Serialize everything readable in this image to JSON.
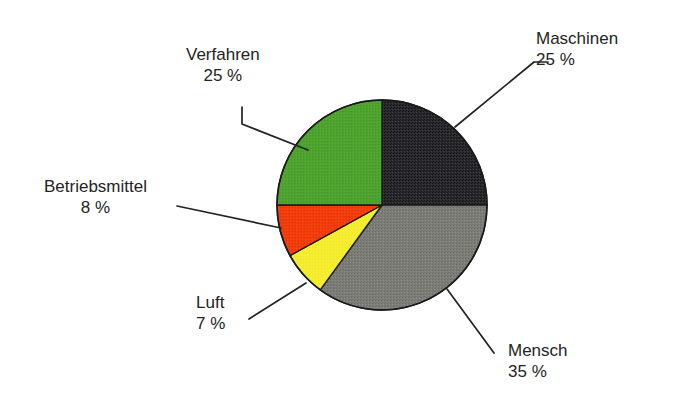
{
  "canvas": {
    "width": 675,
    "height": 415,
    "background": "#ffffff"
  },
  "chart_data": {
    "type": "pie",
    "title": "",
    "subtitle": "",
    "xlabel": "",
    "ylabel": "",
    "legend_position": "none",
    "grid": false,
    "units": "%",
    "total": 100,
    "start_angle_deg": 0,
    "direction": "clockwise",
    "categories": [
      "Maschinen",
      "Mensch",
      "Luft",
      "Betriebsmittel",
      "Verfahren"
    ],
    "values": [
      25,
      35,
      7,
      8,
      25
    ],
    "slices": [
      {
        "label": "Maschinen",
        "value": 25,
        "value_text": "25 %",
        "color": "#2a2a2e",
        "texture": "noise-dark",
        "start_deg": 0,
        "end_deg": 90
      },
      {
        "label": "Mensch",
        "value": 35,
        "value_text": "35 %",
        "color": "#7d7d78",
        "texture": "noise-gray",
        "start_deg": 90,
        "end_deg": 216
      },
      {
        "label": "Luft",
        "value": 7,
        "value_text": "7 %",
        "color": "#f5ee30",
        "texture": "none",
        "start_deg": 216,
        "end_deg": 241.2
      },
      {
        "label": "Betriebsmittel",
        "value": 8,
        "value_text": "8 %",
        "color": "#f23c0a",
        "texture": "none",
        "start_deg": 241.2,
        "end_deg": 270
      },
      {
        "label": "Verfahren",
        "value": 25,
        "value_text": "25 %",
        "color": "#4ea32e",
        "texture": "none",
        "start_deg": 270,
        "end_deg": 360
      }
    ],
    "geometry": {
      "center_x": 382,
      "center_y": 205,
      "radius": 105,
      "outline_color": "#1a1a1a",
      "outline_width": 1.6
    }
  },
  "labels": {
    "verfahren": {
      "name": "Verfahren",
      "value": "25 %"
    },
    "maschinen": {
      "name": "Maschinen",
      "value": "25 %"
    },
    "betriebsmittel": {
      "name": "Betriebsmittel",
      "value": "8 %"
    },
    "luft": {
      "name": "Luft",
      "value": "7 %"
    },
    "mensch": {
      "name": "Mensch",
      "value": "35 %"
    }
  },
  "leader_lines": {
    "color": "#232323",
    "width": 1.7,
    "verfahren": "M 242,107 L 242,124 L 308,150",
    "maschinen": "M 455,127 L 534,62 L 548,62",
    "betriebsmittel": "M 177,206 L 281,228",
    "luft": "M 249,319 L 306,283",
    "mensch": "M 447,289 L 494,353"
  }
}
